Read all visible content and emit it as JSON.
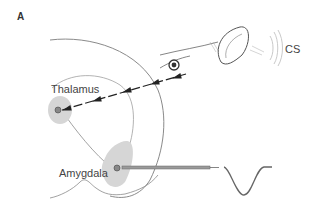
{
  "panel": {
    "letter": "A"
  },
  "labels": {
    "thalamus": "Thalamus",
    "amygdala": "Amygdala",
    "stimulus": "CS"
  },
  "colors": {
    "outline": "#8a8a8a",
    "region_fill": "#d6d6d6",
    "arrow": "#222222",
    "electrode": "#777777",
    "trace": "#666666"
  },
  "icons": [
    "brain-outline",
    "rat-head",
    "ear",
    "eye",
    "sound-waves",
    "neuron",
    "electrode",
    "spike-waveform",
    "dashed-arrow-path"
  ]
}
